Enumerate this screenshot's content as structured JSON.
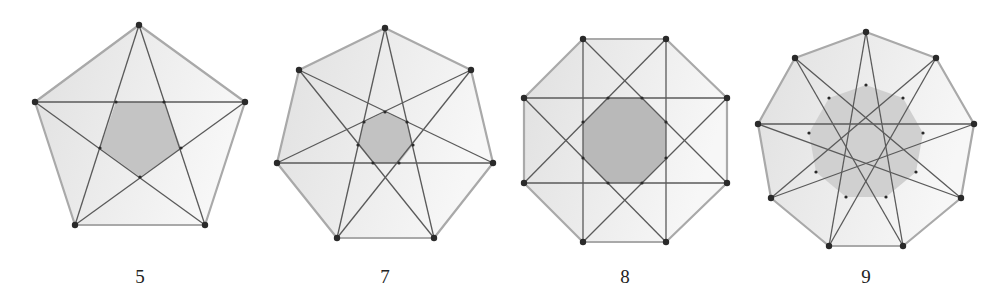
{
  "figure": {
    "colors": {
      "outer_fill_dark": "#e2e2e2",
      "outer_fill_light": "#f6f6f6",
      "outer_stroke": "#a9a9a9",
      "star_stroke": "#5a5a5a",
      "vertex_dot": "#2a2a2a",
      "inner_fill_5": "#c4c4c4",
      "inner_fill_7": "#c2c2c2",
      "inner_fill_8": "#b9b9b9",
      "inner_fill_9": "#d0d0d0"
    },
    "panels": [
      {
        "n": 5,
        "label": "5",
        "step": 2,
        "outer": [
          [
            139,
            25
          ],
          [
            245,
            102
          ],
          [
            205,
            225
          ],
          [
            75,
            225
          ],
          [
            35,
            102
          ]
        ],
        "inner": [
          [
            116,
            102
          ],
          [
            164,
            102
          ],
          [
            181,
            148
          ],
          [
            140,
            177
          ],
          [
            100,
            148
          ]
        ],
        "label_pos": [
          140,
          283
        ]
      },
      {
        "n": 7,
        "label": "7",
        "step": 3,
        "outer": [
          [
            385,
            28
          ],
          [
            471,
            70
          ],
          [
            493,
            163
          ],
          [
            434,
            238
          ],
          [
            337,
            238
          ],
          [
            277,
            163
          ],
          [
            299,
            70
          ]
        ],
        "inner": [
          [
            385,
            112
          ],
          [
            407,
            122
          ],
          [
            413,
            145
          ],
          [
            399,
            163
          ],
          [
            373,
            163
          ],
          [
            358,
            145
          ],
          [
            364,
            122
          ]
        ],
        "label_pos": [
          385,
          283
        ]
      },
      {
        "n": 8,
        "label": "8",
        "step": 3,
        "outer": [
          [
            583,
            39
          ],
          [
            666,
            39
          ],
          [
            727,
            98
          ],
          [
            727,
            183
          ],
          [
            666,
            242
          ],
          [
            583,
            242
          ],
          [
            524,
            183
          ],
          [
            524,
            98
          ]
        ],
        "inner": [
          [
            608,
            98
          ],
          [
            642,
            98
          ],
          [
            666,
            122
          ],
          [
            666,
            158
          ],
          [
            642,
            183
          ],
          [
            608,
            183
          ],
          [
            583,
            158
          ],
          [
            583,
            122
          ]
        ],
        "label_pos": [
          625,
          283
        ]
      },
      {
        "n": 9,
        "label": "9",
        "step": 4,
        "outer": [
          [
            866,
            32
          ],
          [
            936,
            58
          ],
          [
            974,
            124
          ],
          [
            961,
            198
          ],
          [
            903,
            246
          ],
          [
            829,
            246
          ],
          [
            771,
            198
          ],
          [
            758,
            124
          ],
          [
            795,
            58
          ]
        ],
        "inner": [
          [
            866,
            85
          ],
          [
            903,
            98
          ],
          [
            923,
            133
          ],
          [
            916,
            172
          ],
          [
            886,
            197
          ],
          [
            846,
            197
          ],
          [
            816,
            172
          ],
          [
            809,
            133
          ],
          [
            829,
            98
          ]
        ],
        "label_pos": [
          866,
          283
        ]
      }
    ]
  }
}
